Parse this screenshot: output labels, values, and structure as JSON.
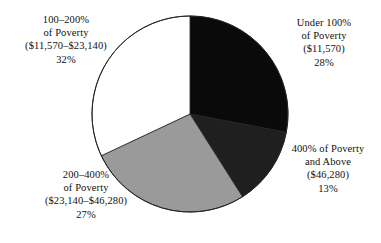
{
  "chart_data": {
    "type": "pie",
    "title": "",
    "subtitle": "",
    "xlabel": "",
    "ylabel": "",
    "grid": false,
    "legend_position": "labels-around-pie",
    "start_angle_deg": 0,
    "direction": "clockwise",
    "categories": [
      "Under 100% of Poverty ($11,570)",
      "400% of Poverty and Above ($46,280)",
      "200–400% of Poverty ($23,140–$46,280)",
      "100–200% of Poverty ($11,570–$23,140)"
    ],
    "values": [
      28,
      13,
      27,
      32
    ],
    "value_unit": "percent",
    "colors": [
      "#0a0a0a",
      "#1f1f1f",
      "#9a9a9a",
      "#ffffff"
    ],
    "slices": [
      {
        "name": "under-100",
        "value": 28,
        "color": "#0a0a0a",
        "start_deg": 0,
        "end_deg": 100.8,
        "label": {
          "line1": "Under 100%",
          "line2": "of Poverty",
          "line3": "($11,570)",
          "line4": "28%"
        }
      },
      {
        "name": "400-and-above",
        "value": 13,
        "color": "#1f1f1f",
        "start_deg": 100.8,
        "end_deg": 147.6,
        "label": {
          "line1": "400% of Poverty",
          "line2": "and Above",
          "line3": "($46,280)",
          "line4": "13%"
        }
      },
      {
        "name": "200-400",
        "value": 27,
        "color": "#9a9a9a",
        "start_deg": 147.6,
        "end_deg": 244.8,
        "label": {
          "line1": "200–400%",
          "line2": "of Poverty",
          "line3": "($23,140–$46,280)",
          "line4": "27%"
        }
      },
      {
        "name": "100-200",
        "value": 32,
        "color": "#ffffff",
        "start_deg": 244.8,
        "end_deg": 360,
        "label": {
          "line1": "100–200%",
          "line2": "of Poverty",
          "line3": "($11,570–$23,140)",
          "line4": "32%"
        }
      }
    ]
  },
  "labels": {
    "under_100": {
      "line1": "Under 100%",
      "line2": "of Poverty",
      "line3": "($11,570)",
      "line4": "28%"
    },
    "above_400": {
      "line1": "400% of Poverty",
      "line2": "and Above",
      "line3": "($46,280)",
      "line4": "13%"
    },
    "pov_200_400": {
      "line1": "200–400%",
      "line2": "of Poverty",
      "line3": "($23,140–$46,280)",
      "line4": "27%"
    },
    "pov_100_200": {
      "line1": "100–200%",
      "line2": "of Poverty",
      "line3": "($11,570–$23,140)",
      "line4": "32%"
    }
  },
  "style": {
    "background": "#ffffff",
    "outline": "#222222",
    "center_x": 190,
    "center_y": 114,
    "radius": 98
  }
}
